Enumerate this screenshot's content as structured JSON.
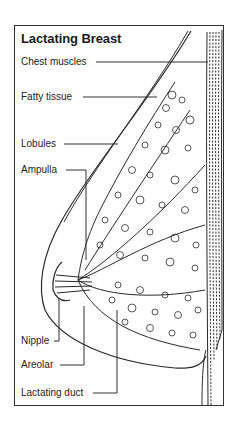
{
  "diagram": {
    "title": "Lactating Breast",
    "labels": [
      {
        "id": "chest-muscles",
        "text": "Chest muscles"
      },
      {
        "id": "fatty-tissue",
        "text": "Fatty tissue"
      },
      {
        "id": "lobules",
        "text": "Lobules"
      },
      {
        "id": "ampulla",
        "text": "Ampulla"
      },
      {
        "id": "nipple",
        "text": "Nipple"
      },
      {
        "id": "areolar",
        "text": "Areolar"
      },
      {
        "id": "lactating-duct",
        "text": "Lactating duct"
      }
    ],
    "colors": {
      "line": "#2a2a2a",
      "background": "#ffffff"
    }
  }
}
